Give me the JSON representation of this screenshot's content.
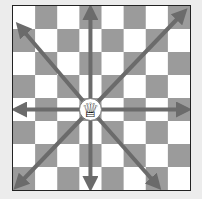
{
  "diagram": {
    "board": {
      "files": 8,
      "ranks": 8,
      "light_color": "#ffffff",
      "dark_color": "#9b9b9b",
      "top_left": "light"
    },
    "piece": {
      "name": "queen",
      "color": "white",
      "square": "d4",
      "glyph": "♕"
    },
    "arrows": {
      "color": "#6b6b6b",
      "directions": [
        "north",
        "south",
        "east",
        "west",
        "north-east",
        "north-west",
        "south-east",
        "south-west"
      ]
    }
  }
}
